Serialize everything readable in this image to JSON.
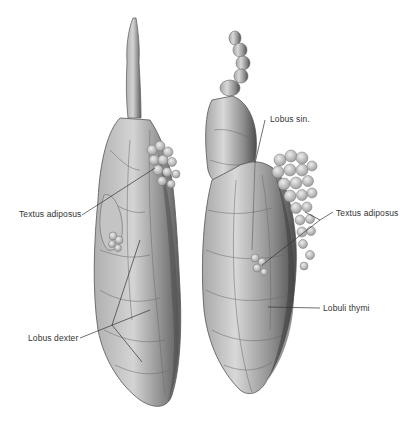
{
  "figure": {
    "labels": [
      {
        "id": "textus-adiposus-left",
        "text": "Textus adiposus",
        "x": 19,
        "y": 209
      },
      {
        "id": "lobus-sin",
        "text": "Lobus sin.",
        "x": 270,
        "y": 114
      },
      {
        "id": "textus-adiposus-right",
        "text": "Textus adiposus",
        "x": 336,
        "y": 208
      },
      {
        "id": "lobuli-thymi",
        "text": "Lobuli thymi",
        "x": 323,
        "y": 304
      },
      {
        "id": "lobus-dexter",
        "text": "Lobus dexter",
        "x": 28,
        "y": 334
      }
    ],
    "colors": {
      "background": "#ffffff",
      "organ_light": "#c8c8c8",
      "organ_mid": "#9a9a9a",
      "organ_dark": "#5a5a5a",
      "line": "#333333",
      "text": "#333333"
    }
  }
}
